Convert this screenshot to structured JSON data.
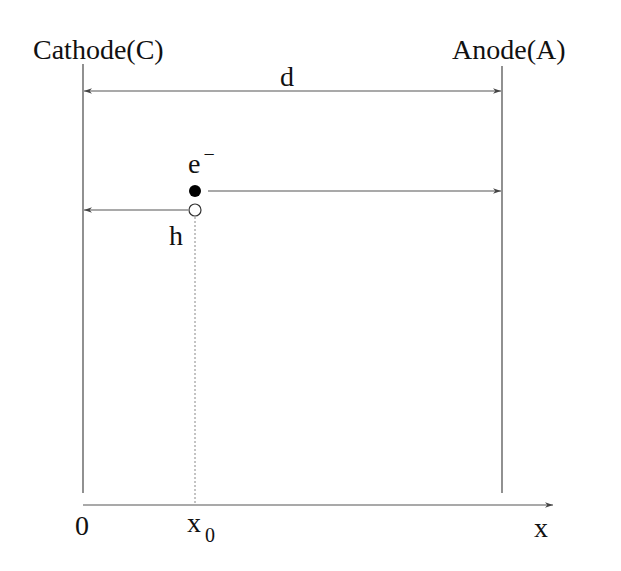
{
  "diagram": {
    "type": "parallel-plate electron-hole drift schematic",
    "labels": {
      "cathode": "Cathode(C)",
      "anode": "Anode(A)",
      "gap": "d",
      "electron": "e",
      "electron_charge": "−",
      "hole": "h",
      "origin": "0",
      "position": "x",
      "position_sub": "0",
      "axis": "x"
    },
    "elements": [
      {
        "id": "cathode-plate",
        "x": 83,
        "y1": 64,
        "y2": 493
      },
      {
        "id": "anode-plate",
        "x": 502,
        "y1": 66,
        "y2": 493
      },
      {
        "id": "gap-arrow",
        "from": "cathode",
        "to": "anode",
        "y": 91,
        "double_headed": true
      },
      {
        "id": "electron",
        "fill": "black",
        "cx": 195,
        "cy": 191,
        "moves_toward": "anode"
      },
      {
        "id": "hole",
        "fill": "white",
        "cx": 195,
        "cy": 210,
        "moves_toward": "cathode"
      },
      {
        "id": "x0-marker",
        "style": "dotted",
        "x": 195
      },
      {
        "id": "x-axis",
        "y": 505,
        "x1": 83,
        "x2": 553
      }
    ],
    "colors": {
      "line": "#555555",
      "text": "#111111",
      "background": "#ffffff"
    }
  }
}
